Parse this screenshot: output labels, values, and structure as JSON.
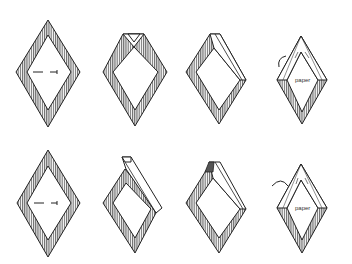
{
  "figure": {
    "rows": [
      {
        "name": "row-1",
        "steps": [
          {
            "step": 1,
            "state": "flat hatched diamond frame with dashed fold mark"
          },
          {
            "step": 2,
            "state": "top corner folded down, small triangular notch"
          },
          {
            "step": 3,
            "state": "upper-right edge folded over"
          },
          {
            "step": 4,
            "state": "upper edges folded, label and curved arrow",
            "label": "paper"
          }
        ]
      },
      {
        "name": "row-2",
        "steps": [
          {
            "step": 1,
            "state": "flat hatched diamond frame with dashed fold mark"
          },
          {
            "step": 2,
            "state": "upper-right strip raised extending above top"
          },
          {
            "step": 3,
            "state": "upper-right strip folded with dark corner tab"
          },
          {
            "step": 4,
            "state": "upper edges folded, label and curved arrow",
            "label": "paper"
          }
        ]
      }
    ],
    "labels": {
      "paper_top": "paper",
      "paper_bottom": "paper"
    },
    "colors": {
      "line": "#222222",
      "hatch": "#444444",
      "background": "#ffffff"
    }
  }
}
